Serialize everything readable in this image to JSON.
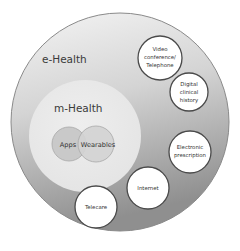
{
  "diagram": {
    "type": "nested-circles",
    "colors": {
      "outer_fill_top": "#f1f1f1",
      "outer_fill_bottom": "#9e9e9e",
      "outer_stroke": "#8a8a8a",
      "mhealth_fill": "#ebebeb",
      "apps_fill": "#c8c8c8",
      "wearables_fill": "#d6d6d6",
      "leaf_fill": "#ffffff",
      "leaf_stroke": "#4a4a4a"
    },
    "outer": {
      "label": "e-Health"
    },
    "inner": {
      "label": "m-Health"
    },
    "inner_items": [
      {
        "label": "Apps"
      },
      {
        "label": "Wearables"
      }
    ],
    "outer_items": [
      {
        "lines": [
          "Video",
          "conference/",
          "Telephone"
        ]
      },
      {
        "lines": [
          "Digital",
          "clinical",
          "history"
        ]
      },
      {
        "lines": [
          "Electronic",
          "prescription"
        ]
      },
      {
        "lines": [
          "Internet"
        ]
      },
      {
        "lines": [
          "Telecare"
        ]
      }
    ]
  }
}
